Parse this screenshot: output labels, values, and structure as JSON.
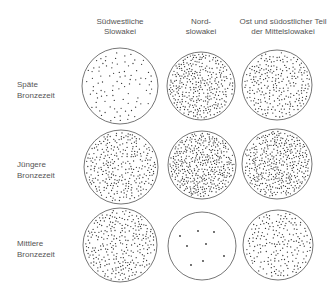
{
  "columns": [
    {
      "line1": "Südwestliche",
      "line2": "Slowakei",
      "cx": 120
    },
    {
      "line1": "Nord-",
      "line2": "slowakei",
      "cx": 201
    },
    {
      "line1": "Ost und südostlicher Teil",
      "line2": "der Mittelslowakei",
      "cx": 283
    }
  ],
  "rows": [
    {
      "line1": "Späte",
      "line2": "Bronzezeit",
      "cy": 86
    },
    {
      "line1": "Jüngere",
      "line2": "Bronzezeit",
      "cy": 166
    },
    {
      "line1": "Mittlere",
      "line2": "Bronzezeit",
      "cy": 245
    }
  ],
  "circles": [
    {
      "row": 0,
      "col": 0,
      "cx": 120,
      "cy": 86,
      "r": 38,
      "density": "sparse",
      "dots": 95
    },
    {
      "row": 0,
      "col": 1,
      "cx": 201,
      "cy": 86,
      "r": 34,
      "density": "dense",
      "dots": 330
    },
    {
      "row": 0,
      "col": 2,
      "cx": 277,
      "cy": 85,
      "r": 35,
      "density": "medium-dense",
      "dots": 260
    },
    {
      "row": 1,
      "col": 0,
      "cx": 121,
      "cy": 167,
      "r": 37,
      "density": "dense",
      "dots": 300
    },
    {
      "row": 1,
      "col": 1,
      "cx": 202,
      "cy": 165,
      "r": 34,
      "density": "very-dense",
      "dots": 400
    },
    {
      "row": 1,
      "col": 2,
      "cx": 277,
      "cy": 164,
      "r": 35,
      "density": "very-dense",
      "dots": 390
    },
    {
      "row": 2,
      "col": 0,
      "cx": 120,
      "cy": 245,
      "r": 37,
      "density": "dense",
      "dots": 280
    },
    {
      "row": 2,
      "col": 1,
      "cx": 202,
      "cy": 246,
      "r": 34,
      "density": "very-sparse",
      "fixed_dots": [
        [
          180,
          236
        ],
        [
          198,
          231
        ],
        [
          214,
          232
        ],
        [
          187,
          246
        ],
        [
          206,
          244
        ],
        [
          224,
          256
        ],
        [
          191,
          265
        ],
        [
          203,
          261
        ]
      ]
    },
    {
      "row": 2,
      "col": 2,
      "cx": 278,
      "cy": 245,
      "r": 35,
      "density": "medium",
      "dots": 200
    }
  ],
  "colors": {
    "outline": "#666666",
    "dot": "#333333",
    "text": "#555555",
    "background": "#ffffff"
  }
}
